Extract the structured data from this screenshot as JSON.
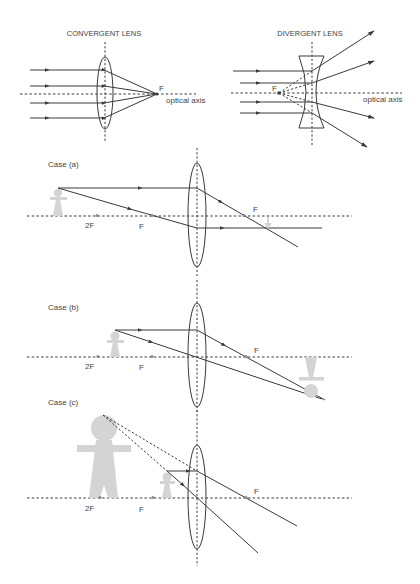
{
  "panels": {
    "convergent": {
      "title": "CONVERGENT LENS",
      "focus_label": "F",
      "axis_label": "optical axis"
    },
    "divergent": {
      "title": "DIVERGENT LENS",
      "focus_label": "F",
      "axis_label": "optical axis"
    }
  },
  "cases": [
    {
      "label": "Case (a)",
      "two_f": "2F",
      "f_left": "F",
      "f_right": "F"
    },
    {
      "label": "Case (b)",
      "two_f": "2F",
      "f_left": "F",
      "f_right": "F"
    },
    {
      "label": "Case (c)",
      "two_f": "2F",
      "f_left": "F",
      "f_right": "F"
    }
  ],
  "colors": {
    "line": "#3a3a3a",
    "figure": "#d4d4d4",
    "text": "#444444",
    "background": "#ffffff"
  }
}
